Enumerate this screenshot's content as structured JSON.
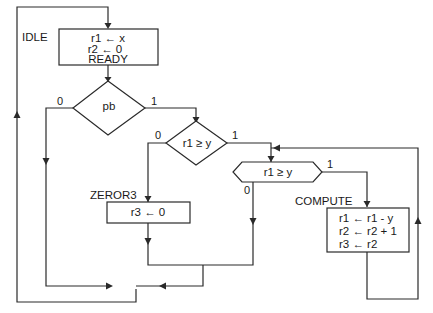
{
  "diagram": {
    "type": "ASM flowchart",
    "states": {
      "idle": {
        "label": "IDLE",
        "lines": [
          "r1 ← x",
          "r2 ← 0",
          "READY"
        ]
      },
      "zeror3": {
        "label": "ZEROR3",
        "lines": [
          "r3 ← 0"
        ]
      },
      "compute": {
        "label": "COMPUTE",
        "lines": [
          "r1 ← r1 - y",
          "r2 ← r2 + 1",
          "r3 ← r2"
        ]
      }
    },
    "decisions": {
      "pb": {
        "text": "pb",
        "false_label": "0",
        "true_label": "1"
      },
      "cmp1": {
        "text": "r1 ≥ y",
        "false_label": "0",
        "true_label": "1"
      },
      "cmp2": {
        "text": "r1 ≥ y",
        "false_label": "0",
        "true_label": "1"
      }
    }
  }
}
